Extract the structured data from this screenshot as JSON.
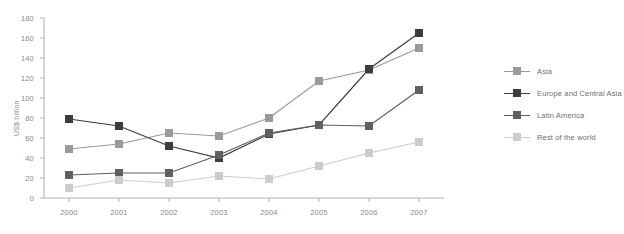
{
  "chart_data": {
    "type": "line",
    "title": "",
    "xlabel": "",
    "ylabel": "US$ billion",
    "categories": [
      "2000",
      "2001",
      "2002",
      "2003",
      "2004",
      "2005",
      "2006",
      "2007"
    ],
    "ylim": [
      0,
      180
    ],
    "yticks": [
      "0",
      "20",
      "40",
      "60",
      "80",
      "100",
      "120",
      "140",
      "160",
      "180"
    ],
    "grid": false,
    "legend_position": "right",
    "series": [
      {
        "name": "Asia",
        "color": "#9a9a9a",
        "values": [
          49,
          54,
          65,
          62,
          80,
          117,
          128,
          150
        ]
      },
      {
        "name": "Europe and Central Asia",
        "color": "#3d3d3d",
        "values": [
          79,
          72,
          52,
          40,
          64,
          73,
          129,
          165
        ]
      },
      {
        "name": "Latin America",
        "color": "#606060",
        "values": [
          23,
          25,
          25,
          43,
          65,
          73,
          72,
          108
        ]
      },
      {
        "name": "Rest of the world",
        "color": "#cccccc",
        "values": [
          10,
          18,
          15,
          22,
          19,
          32,
          45,
          56
        ]
      }
    ]
  },
  "axis": {
    "line_color": "#b0b0b0",
    "label_color": "#8a8a8a"
  }
}
